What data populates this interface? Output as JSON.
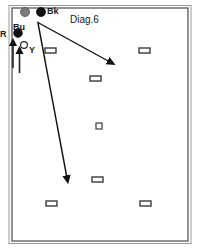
{
  "diagram": {
    "title": "Diag.6",
    "frame": {
      "x": 12,
      "y": 8,
      "width": 176,
      "height": 233,
      "border_color": "#4a4a4a"
    },
    "labels": [
      {
        "id": "bu",
        "text": "Bu",
        "x": 14,
        "y": 29
      },
      {
        "id": "bk",
        "text": "Bk",
        "x": 47,
        "y": 14
      },
      {
        "id": "r",
        "text": "R",
        "x": 1,
        "y": 35
      },
      {
        "id": "y",
        "text": "Y",
        "x": 29,
        "y": 52
      }
    ],
    "players": [
      {
        "id": "player-grey-top",
        "label": "Bu",
        "shape": "circle-filled",
        "color": "#7a7a7a",
        "cx": 25,
        "cy": 12,
        "r": 4.6
      },
      {
        "id": "player-black-top",
        "label": "Bk",
        "shape": "circle-filled",
        "color": "#111111",
        "cx": 41,
        "cy": 12,
        "r": 4.6
      },
      {
        "id": "player-grey-left",
        "label": "R",
        "shape": "circle-filled",
        "color": "#4a4a4a",
        "cx": 18,
        "cy": 33,
        "r": 4.4
      },
      {
        "id": "player-open-y",
        "label": "Y",
        "shape": "circle-open",
        "color": "#ffffff",
        "cx": 24,
        "cy": 45,
        "r": 3.4
      }
    ],
    "arrows": [
      {
        "id": "arrow-to-lower-right",
        "from": {
          "x": 37,
          "y": 22
        },
        "to": {
          "x": 113,
          "y": 64
        },
        "description": "long movement path toward lower right"
      },
      {
        "id": "arrow-to-lower-left",
        "from": {
          "x": 38,
          "y": 23
        },
        "to": {
          "x": 68,
          "y": 182
        },
        "description": "long movement path toward lower centre-left"
      },
      {
        "id": "arrow-short-up-outer",
        "from": {
          "x": 13,
          "y": 68
        },
        "to": {
          "x": 13,
          "y": 40
        },
        "description": "short upward movement arrow"
      },
      {
        "id": "arrow-short-up-inner",
        "from": {
          "x": 19,
          "y": 72
        },
        "to": {
          "x": 19,
          "y": 48
        },
        "description": "short upward movement arrow"
      }
    ],
    "field_markers": [
      {
        "id": "marker-left-upper",
        "x": 45,
        "y": 48,
        "width": 11,
        "height": 5,
        "size": "normal"
      },
      {
        "id": "marker-right-upper",
        "x": 139,
        "y": 48,
        "width": 11,
        "height": 5,
        "size": "normal"
      },
      {
        "id": "marker-centre-upper",
        "x": 90,
        "y": 76,
        "width": 11,
        "height": 5,
        "size": "normal"
      },
      {
        "id": "marker-centre-mid",
        "x": 96,
        "y": 123,
        "width": 6,
        "height": 6,
        "size": "small"
      },
      {
        "id": "marker-centre-lower",
        "x": 92,
        "y": 177,
        "width": 11,
        "height": 5,
        "size": "normal"
      },
      {
        "id": "marker-left-lower",
        "x": 46,
        "y": 201,
        "width": 11,
        "height": 5,
        "size": "normal"
      },
      {
        "id": "marker-right-lower",
        "x": 140,
        "y": 201,
        "width": 11,
        "height": 5,
        "size": "normal"
      }
    ],
    "colors": {
      "frame": "#4a4a4a",
      "line": "#111111",
      "marker_stroke": "#3a3a3a",
      "background": "#ffffff"
    }
  }
}
